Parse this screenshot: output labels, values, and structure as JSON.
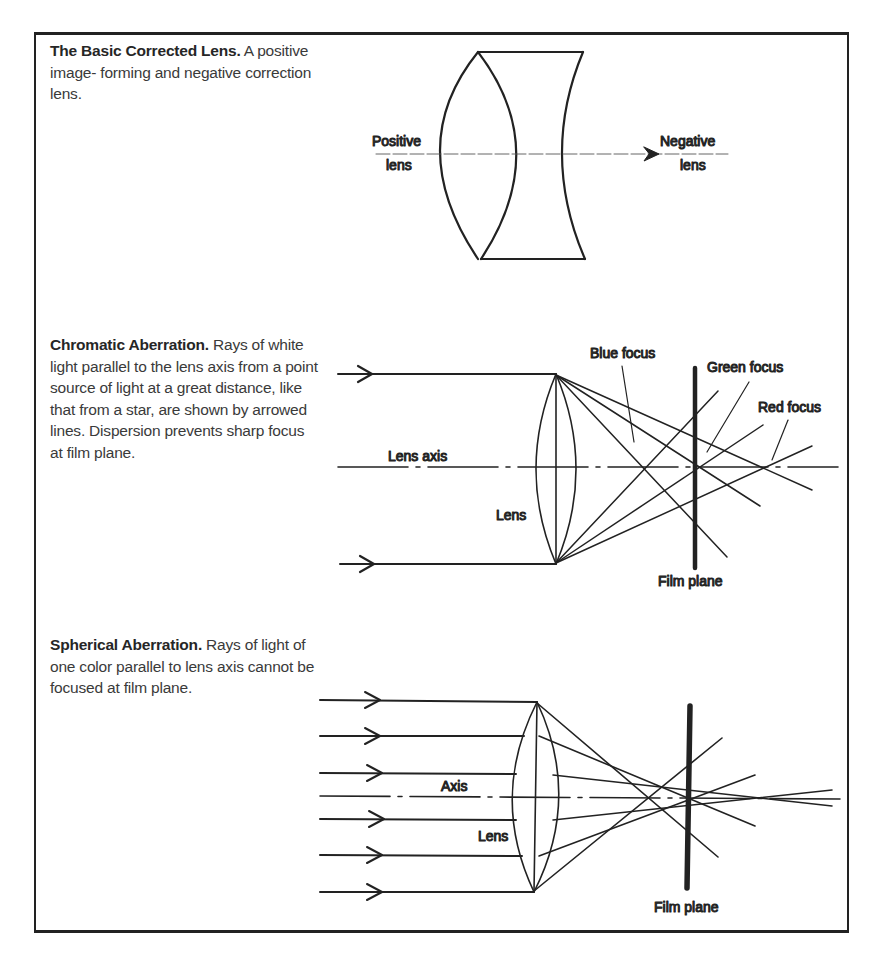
{
  "sections": [
    {
      "id": "basic-corrected-lens",
      "title": "The Basic Corrected Lens.",
      "body": "A positive image- forming and negative correction lens.",
      "labels": {
        "positive_line1": "Positive",
        "positive_line2": "lens",
        "negative_line1": "Negative",
        "negative_line2": "lens"
      }
    },
    {
      "id": "chromatic-aberration",
      "title": "Chromatic Aberration.",
      "body": "Rays of white light parallel to the lens axis from a point source of light at a great distance, like that from a star, are shown by arrowed lines. Dispersion prevents sharp focus at film plane.",
      "labels": {
        "blue_focus": "Blue focus",
        "green_focus": "Green focus",
        "red_focus": "Red focus",
        "lens_axis": "Lens axis",
        "lens": "Lens",
        "film_plane": "Film plane"
      }
    },
    {
      "id": "spherical-aberration",
      "title": "Spherical Aberration.",
      "body": "Rays of light of one color parallel to lens axis cannot be focused at film plane.",
      "labels": {
        "axis": "Axis",
        "lens": "Lens",
        "film_plane": "Film plane"
      }
    }
  ],
  "colors": {
    "ink": "#222222",
    "text": "#3a3a3a",
    "background": "#ffffff"
  }
}
